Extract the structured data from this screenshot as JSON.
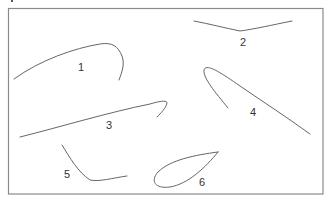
{
  "figure": {
    "stroke_color": "#666666",
    "frame_color": "#8a8a8a",
    "label_color": "#333333",
    "curves": [
      {
        "id": "1",
        "label": "1",
        "shape": "arch rising left to right then hooking down"
      },
      {
        "id": "2",
        "label": "2",
        "shape": "shallow V"
      },
      {
        "id": "3",
        "label": "3",
        "shape": "long rising line with hook at right end"
      },
      {
        "id": "4",
        "label": "4",
        "shape": "hairpin opening to lower right"
      },
      {
        "id": "5",
        "label": "5",
        "shape": "descending curve flattening to the right"
      },
      {
        "id": "6",
        "label": "6",
        "shape": "closed teardrop loop"
      }
    ]
  }
}
